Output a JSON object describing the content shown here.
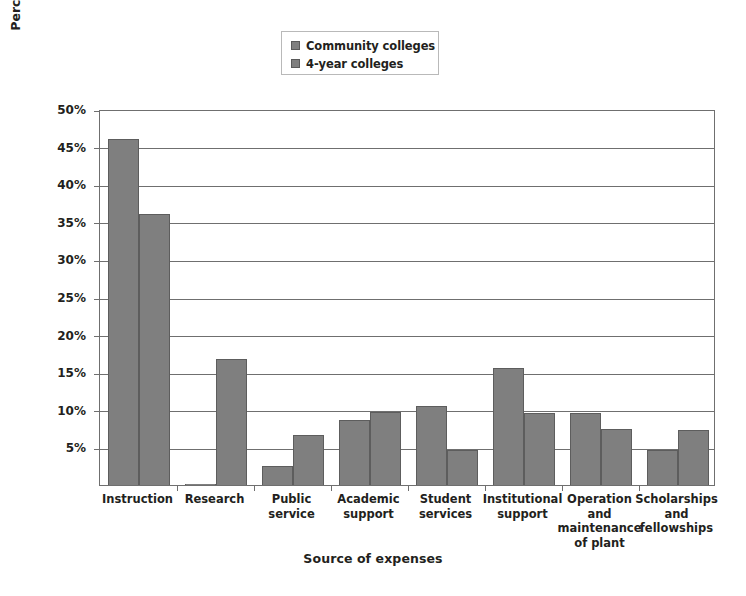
{
  "chart_data": {
    "type": "bar",
    "title": "",
    "xlabel": "Source of expenses",
    "ylabel": "Percentage of expenses",
    "ylim": [
      0,
      50
    ],
    "ytick_labels": [
      "50%",
      "45%",
      "40%",
      "35%",
      "30%",
      "25%",
      "20%",
      "15%",
      "10%",
      "5%"
    ],
    "ytick_values": [
      50,
      45,
      40,
      35,
      30,
      25,
      20,
      15,
      10,
      5
    ],
    "grid": true,
    "legend_position": "top-center",
    "categories": [
      "Instruction",
      "Research",
      "Public service",
      "Academic support",
      "Student services",
      "Institutional support",
      "Operation and maintenance of plant",
      "Scholarships and fellowships"
    ],
    "category_lines": [
      [
        "Instruction"
      ],
      [
        "Research"
      ],
      [
        "Public",
        "service"
      ],
      [
        "Academic",
        "support"
      ],
      [
        "Student",
        "services"
      ],
      [
        "Institutional",
        "support"
      ],
      [
        "Operation",
        "and",
        "maintenance",
        "of plant"
      ],
      [
        "Scholarships",
        "and",
        "fellowships"
      ]
    ],
    "series": [
      {
        "name": "Community colleges",
        "color": "#7f7f7f",
        "values": [
          46.0,
          0.2,
          2.5,
          8.6,
          10.5,
          15.6,
          9.6,
          4.7
        ]
      },
      {
        "name": "4-year colleges",
        "color": "#7f7f7f",
        "values": [
          36.0,
          16.8,
          6.6,
          9.7,
          4.7,
          9.6,
          7.4,
          7.3
        ]
      }
    ]
  },
  "legend": {
    "items": [
      {
        "label": "Community colleges",
        "swatch": "legend-swatch-community-colleges"
      },
      {
        "label": "4-year colleges",
        "swatch": "legend-swatch-4-year-colleges"
      }
    ]
  },
  "axes": {
    "x_title": "Source of expenses",
    "y_title": "Percentage of expenses"
  }
}
